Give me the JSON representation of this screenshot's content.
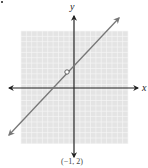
{
  "chart_data": {
    "type": "line",
    "title": "",
    "xlabel": "x",
    "ylabel": "y",
    "grid": true,
    "xlim": [
      -7,
      7
    ],
    "ylim": [
      -7,
      7
    ],
    "series": [
      {
        "name": "y = x + 3 (x ≠ -1)",
        "x": [
          -7,
          6
        ],
        "y": [
          -4,
          9
        ],
        "slope": 1,
        "intercept": 3,
        "arrows_both_ends": true
      }
    ],
    "open_points": [
      {
        "x": -1,
        "y": 2
      }
    ],
    "annotations": [
      {
        "text": "(−1, 2)",
        "position": "below-plot"
      }
    ]
  },
  "labels": {
    "x_axis": "x",
    "y_axis": "y",
    "caption": "(−1, 2)"
  },
  "colors": {
    "grid_bg": "#e6e6e6",
    "grid_line": "#ffffff",
    "axis": "#222222",
    "line": "#777777"
  }
}
